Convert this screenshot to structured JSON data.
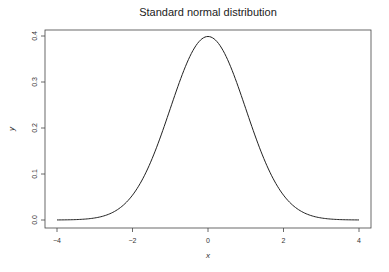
{
  "chart_data": {
    "type": "line",
    "title": "Standard normal distribution",
    "xlabel": "x",
    "ylabel": "y",
    "xlim": [
      -4,
      4
    ],
    "ylim": [
      0,
      0.4
    ],
    "x_ticks": [
      -4,
      -2,
      0,
      2,
      4
    ],
    "x_tick_labels": [
      "−4",
      "−2",
      "0",
      "2",
      "4"
    ],
    "y_ticks": [
      0.0,
      0.1,
      0.2,
      0.3,
      0.4
    ],
    "y_tick_labels": [
      "0.0",
      "0.1",
      "0.2",
      "0.3",
      "0.4"
    ],
    "grid": false,
    "legend": null,
    "series": [
      {
        "name": "density",
        "function": "standard normal pdf",
        "color": "#222222",
        "x": [
          -4,
          -3.5,
          -3,
          -2.5,
          -2,
          -1.5,
          -1,
          -0.5,
          0,
          0.5,
          1,
          1.5,
          2,
          2.5,
          3,
          3.5,
          4
        ],
        "y": [
          0.0001,
          0.0009,
          0.0044,
          0.0175,
          0.054,
          0.1295,
          0.242,
          0.3521,
          0.3989,
          0.3521,
          0.242,
          0.1295,
          0.054,
          0.0175,
          0.0044,
          0.0009,
          0.0001
        ]
      }
    ]
  }
}
